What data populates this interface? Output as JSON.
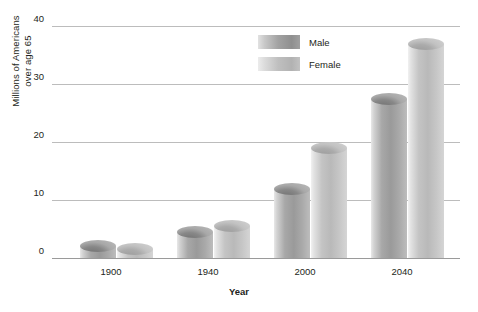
{
  "chart_data": {
    "type": "bar",
    "title": "",
    "subtitle": "",
    "xlabel": "Year",
    "ylabel": "Millions of Americans over age 65",
    "ylabel_line1": "Millions of Americans",
    "ylabel_line2": "over age 65",
    "categories": [
      "1900",
      "1940",
      "2000",
      "2040"
    ],
    "series": [
      {
        "name": "Male",
        "values": [
          3.1,
          5.5,
          13.0,
          28.5
        ]
      },
      {
        "name": "Female",
        "values": [
          2.6,
          6.6,
          20.0,
          38.0
        ]
      }
    ],
    "ylim": [
      0,
      40
    ],
    "yticks": [
      "40",
      "30",
      "20",
      "10",
      "0"
    ],
    "ytick_values": [
      40,
      30,
      20,
      10,
      0
    ],
    "grid": true,
    "legend_position": "top-center-right",
    "legend": [
      "Male",
      "Female"
    ],
    "colors": {
      "male": "#9a9a9a",
      "female": "#bdbdbd",
      "gridline": "#bcbcbc",
      "axis": "#9a9a9a",
      "text": "#231f20",
      "background": "#ffffff"
    }
  }
}
